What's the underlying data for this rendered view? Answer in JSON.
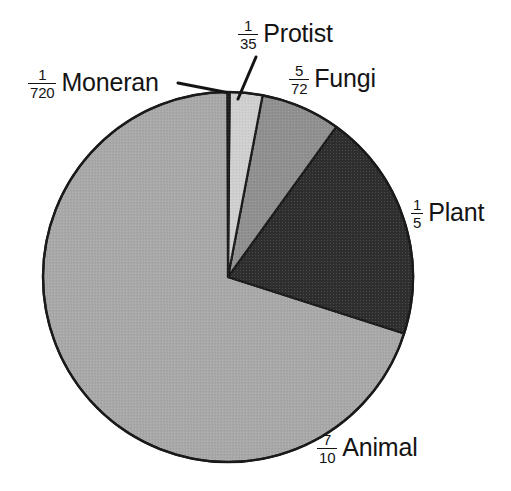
{
  "chart_data": {
    "type": "pie",
    "title": "",
    "subtitle": "",
    "xlabel": "",
    "ylabel": "",
    "legend_position": "none",
    "grid": false,
    "labels_in_chart": true,
    "total_fraction": "1",
    "start_angle_deg": 0,
    "direction": "clockwise",
    "categories": [
      "Moneran",
      "Protist",
      "Fungi",
      "Plant",
      "Animal"
    ],
    "values": [
      0.001389,
      0.028571,
      0.069444,
      0.2,
      0.7
    ],
    "fractions": [
      "1/720",
      "1/35",
      "5/72",
      "1/5",
      "7/10"
    ],
    "slices": [
      {
        "name": "Moneran",
        "fraction": "1/720",
        "numerator": "1",
        "denominator": "720",
        "value": 0.001389,
        "percent": 0.14,
        "angle_deg": 0.5,
        "start_deg": 0,
        "end_deg": 0.5,
        "color": "#b9b9b9",
        "label_text": "Moneran",
        "has_leader_line": true
      },
      {
        "name": "Protist",
        "fraction": "1/35",
        "numerator": "1",
        "denominator": "35",
        "value": 0.028571,
        "percent": 2.86,
        "angle_deg": 10.29,
        "start_deg": 0.5,
        "end_deg": 10.79,
        "color": "#cfcfcf",
        "label_text": "Protist",
        "has_leader_line": true
      },
      {
        "name": "Fungi",
        "fraction": "5/72",
        "numerator": "5",
        "denominator": "72",
        "value": 0.069444,
        "percent": 6.94,
        "angle_deg": 25.0,
        "start_deg": 10.79,
        "end_deg": 35.79,
        "color": "#8f8f8f",
        "label_text": "Fungi",
        "has_leader_line": false
      },
      {
        "name": "Plant",
        "fraction": "1/5",
        "numerator": "1",
        "denominator": "5",
        "value": 0.2,
        "percent": 20.0,
        "angle_deg": 72.0,
        "start_deg": 35.79,
        "end_deg": 107.79,
        "color": "#2e2e2e",
        "label_text": "Plant",
        "has_leader_line": false
      },
      {
        "name": "Animal",
        "fraction": "7/10",
        "numerator": "7",
        "denominator": "10",
        "value": 0.7,
        "percent": 70.0,
        "angle_deg": 252.0,
        "start_deg": 107.79,
        "end_deg": 359.79,
        "color": "#a8a8a8",
        "label_text": "Animal",
        "has_leader_line": false
      }
    ],
    "geometry": {
      "center_x": 228,
      "center_y": 277,
      "radius": 185
    },
    "colors": {
      "background": "#ffffff",
      "outline": "#1a1a1a",
      "text": "#141414",
      "moneran": "#b9b9b9",
      "protist": "#cfcfcf",
      "fungi": "#8f8f8f",
      "plant": "#2e2e2e",
      "animal": "#a8a8a8"
    }
  },
  "labels": {
    "moneran": {
      "num": "1",
      "den": "720",
      "text": "Moneran"
    },
    "protist": {
      "num": "1",
      "den": "35",
      "text": "Protist"
    },
    "fungi": {
      "num": "5",
      "den": "72",
      "text": "Fungi"
    },
    "plant": {
      "num": "1",
      "den": "5",
      "text": "Plant"
    },
    "animal": {
      "num": "7",
      "den": "10",
      "text": "Animal"
    }
  }
}
